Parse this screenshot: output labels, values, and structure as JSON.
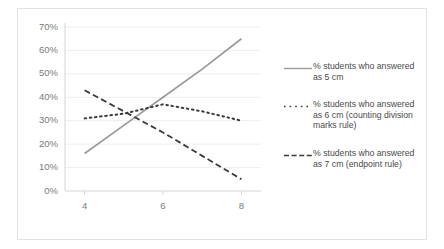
{
  "chart_data": {
    "type": "line",
    "title": "",
    "xlabel": "",
    "ylabel": "",
    "xlim": [
      3.5,
      8.5
    ],
    "ylim": [
      0,
      70
    ],
    "grid": true,
    "legend_position": "right",
    "x_ticks": [
      "4",
      "6",
      "8"
    ],
    "x_tick_values": [
      4,
      6,
      8
    ],
    "y_ticks": [
      "0%",
      "10%",
      "20%",
      "30%",
      "40%",
      "50%",
      "60%",
      "70%"
    ],
    "y_tick_values": [
      0,
      10,
      20,
      30,
      40,
      50,
      60,
      70
    ],
    "x": [
      4,
      5,
      6,
      7,
      8
    ],
    "series": [
      {
        "name": "% students who answered as 5 cm",
        "style": "solid",
        "color": "#9a9a9a",
        "values": [
          16,
          28,
          40,
          52,
          65
        ]
      },
      {
        "name": "% students who answered as 6 cm (counting division marks rule)",
        "style": "dotted",
        "color": "#3a3a3a",
        "values": [
          31,
          33,
          37,
          34,
          30
        ]
      },
      {
        "name": "% students who answered as 7 cm  (endpoint rule)",
        "style": "dashed",
        "color": "#3a3a3a",
        "values": [
          43,
          34,
          25,
          15,
          5
        ]
      }
    ]
  },
  "legend": {
    "items": [
      {
        "label": "% students who answered as 5 cm",
        "key": "solid-line-key"
      },
      {
        "label": "% students who answered as 6 cm (counting division marks rule)",
        "key": "dotted-line-key"
      },
      {
        "label": "% students who answered as 7 cm  (endpoint rule)",
        "key": "dashed-line-key"
      }
    ]
  },
  "colors": {
    "grid": "#eeeeee",
    "axis": "#d6d6d6",
    "tick_text": "#7a7a7a",
    "legend_text": "#4a4a4a",
    "frame_border": "#e3e3e3",
    "series_solid": "#9a9a9a",
    "series_dark": "#3a3a3a"
  }
}
